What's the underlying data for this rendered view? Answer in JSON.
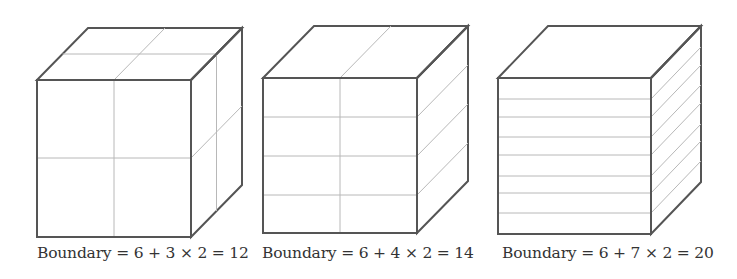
{
  "figure": {
    "colors": {
      "edge": "#555555",
      "grid": "#b8b8b8",
      "text": "#333333",
      "background": "#ffffff"
    },
    "cubes": [
      {
        "name": "cube-3-cuts",
        "caption": "Boundary = 6 + 3 × 2 = 12",
        "caption_x": 37,
        "front": {
          "x": 37,
          "y": 80,
          "w": 154,
          "h": 157
        },
        "depth": {
          "dx": 51,
          "dy": -52
        },
        "front_h_lines": [
          158
        ],
        "front_v_lines": [
          114
        ],
        "top_h_lines": [
          0.5
        ],
        "top_v_lines": [
          114
        ],
        "right_depth_lines": [
          0.5
        ],
        "right_h_lines": [
          158
        ]
      },
      {
        "name": "cube-4-cuts",
        "caption": "Boundary = 6 + 4 × 2 = 14",
        "caption_x": 262,
        "front": {
          "x": 263,
          "y": 78,
          "w": 154,
          "h": 155
        },
        "depth": {
          "dx": 51,
          "dy": -52
        },
        "front_h_lines": [
          117,
          156,
          195
        ],
        "front_v_lines": [
          340
        ],
        "top_h_lines": [],
        "top_v_lines": [
          340
        ],
        "right_depth_lines": [],
        "right_h_lines": [
          117,
          156,
          195
        ]
      },
      {
        "name": "cube-7-cuts",
        "caption": "Boundary = 6 + 7 × 2 = 20",
        "caption_x": 502,
        "front": {
          "x": 498,
          "y": 78,
          "w": 153,
          "h": 156
        },
        "depth": {
          "dx": 50,
          "dy": -52
        },
        "front_h_lines": [
          99,
          117,
          137,
          155,
          176,
          193,
          213
        ],
        "front_v_lines": [],
        "top_h_lines": [],
        "top_v_lines": [],
        "right_depth_lines": [],
        "right_h_lines": [
          99,
          117,
          137,
          155,
          176,
          193,
          213
        ]
      }
    ]
  }
}
